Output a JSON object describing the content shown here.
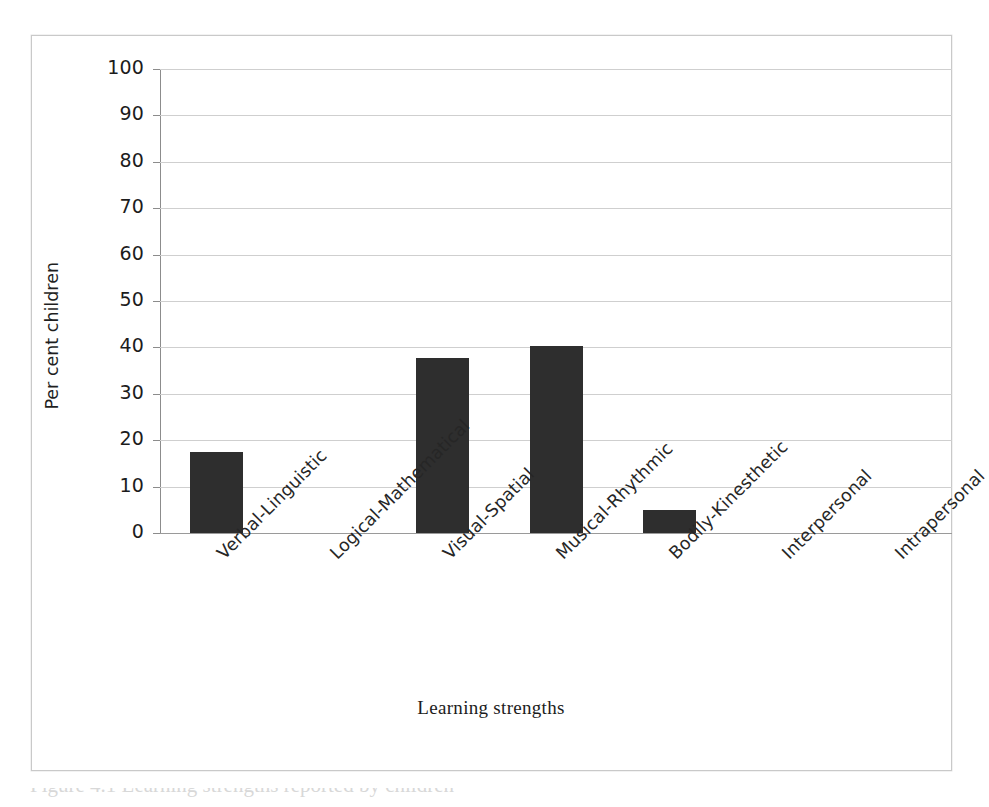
{
  "figure": {
    "background_color": "#ffffff",
    "frame_color": "#c9c9c9",
    "caption_partial": "Figure 4.1 Learning strengths reported by children"
  },
  "chart_data": {
    "type": "bar",
    "title": "",
    "subtitle": "",
    "xlabel": "Learning strengths",
    "ylabel": "Per cent children",
    "categories": [
      "Verbal-Linguistic",
      "Logical-Mathematical",
      "Visual-Spatial",
      "Musical-Rhythmic",
      "Bodily-Kinesthetic",
      "Interpersonal",
      "Intrapersonal"
    ],
    "values": [
      17.5,
      0,
      37.7,
      40.3,
      5.0,
      0,
      0
    ],
    "ylim": [
      0,
      100
    ],
    "ytick_values": [
      0,
      10,
      20,
      30,
      40,
      50,
      60,
      70,
      80,
      90,
      100
    ],
    "ytick_labels": [
      "0",
      "10",
      "20",
      "30",
      "40",
      "50",
      "60",
      "70",
      "80",
      "90",
      "100"
    ],
    "grid": true,
    "grid_axis": "y",
    "grid_color": "#cfcfcf",
    "legend": false,
    "legend_position": "none",
    "bar_color": "#2e2e2e",
    "axis_color": "#8c8c8c",
    "category_label_rotation": -45
  }
}
